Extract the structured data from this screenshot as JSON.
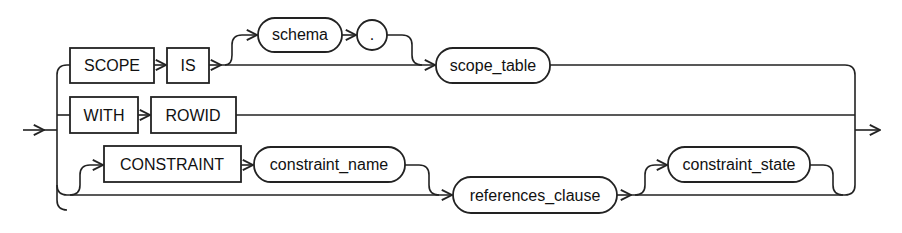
{
  "diagram": {
    "type": "railroad-syntax",
    "keywords": {
      "scope": "SCOPE",
      "is": "IS",
      "with": "WITH",
      "rowid": "ROWID",
      "constraint": "CONSTRAINT"
    },
    "nonterminals": {
      "schema": "schema",
      "scope_table": "scope_table",
      "constraint_name": "constraint_name",
      "references_clause": "references_clause",
      "constraint_state": "constraint_state"
    },
    "punctuation": {
      "dot": "."
    },
    "branches": [
      [
        "SCOPE",
        "IS",
        "[schema .]",
        "scope_table"
      ],
      [
        "WITH",
        "ROWID"
      ],
      [
        "[CONSTRAINT constraint_name]",
        "references_clause",
        "[constraint_state]"
      ]
    ]
  }
}
